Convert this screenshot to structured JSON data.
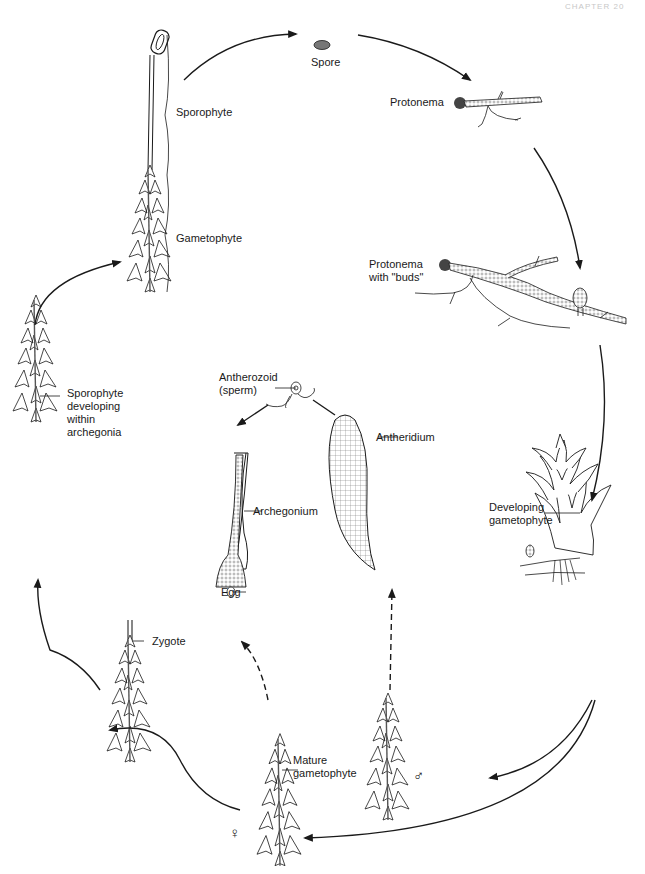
{
  "diagram": {
    "page_header": "CHAPTER 20",
    "ink_color": "#1a1a1a",
    "background": "#ffffff",
    "stages": [
      {
        "id": "sporophyte-mature",
        "label": "Sporophyte"
      },
      {
        "id": "gametophyte-mature-with-sporophyte",
        "label": "Gametophyte"
      },
      {
        "id": "spore",
        "label": "Spore"
      },
      {
        "id": "protonema",
        "label": "Protonema"
      },
      {
        "id": "protonema-buds",
        "label": "Protonema\nwith \"buds\""
      },
      {
        "id": "developing-gametophyte",
        "label": "Developing\ngametophyte"
      },
      {
        "id": "antheridium",
        "label": "Antheridium"
      },
      {
        "id": "antherozoid",
        "label": "Antherozoid\n(sperm)"
      },
      {
        "id": "archegonium",
        "label": "Archegonium"
      },
      {
        "id": "egg",
        "label": "Egg"
      },
      {
        "id": "mature-gametophyte",
        "label": "Mature\ngametophyte"
      },
      {
        "id": "zygote",
        "label": "Zygote"
      },
      {
        "id": "sporophyte-developing",
        "label": "Sporophyte\ndeveloping\nwithin\narchegonia"
      }
    ],
    "symbols": {
      "male": "♂",
      "female": "♀"
    },
    "edges": [
      {
        "from": "sporophyte-mature",
        "to": "spore",
        "style": "solid"
      },
      {
        "from": "spore",
        "to": "protonema",
        "style": "solid"
      },
      {
        "from": "protonema",
        "to": "protonema-buds",
        "style": "solid"
      },
      {
        "from": "protonema-buds",
        "to": "developing-gametophyte",
        "style": "solid"
      },
      {
        "from": "developing-gametophyte",
        "to": "male-gametophyte",
        "style": "solid"
      },
      {
        "from": "developing-gametophyte",
        "to": "female-gametophyte",
        "style": "solid"
      },
      {
        "from": "male-gametophyte",
        "to": "antheridium",
        "style": "dashed"
      },
      {
        "from": "antheridium",
        "to": "antherozoid",
        "style": "solid"
      },
      {
        "from": "antherozoid",
        "to": "archegonium",
        "style": "solid"
      },
      {
        "from": "female-gametophyte",
        "to": "archegonium",
        "style": "dashed"
      },
      {
        "from": "female-gametophyte",
        "to": "zygote",
        "style": "solid"
      },
      {
        "from": "zygote",
        "to": "sporophyte-developing",
        "style": "solid"
      },
      {
        "from": "sporophyte-developing",
        "to": "sporophyte-mature",
        "style": "solid"
      }
    ]
  }
}
